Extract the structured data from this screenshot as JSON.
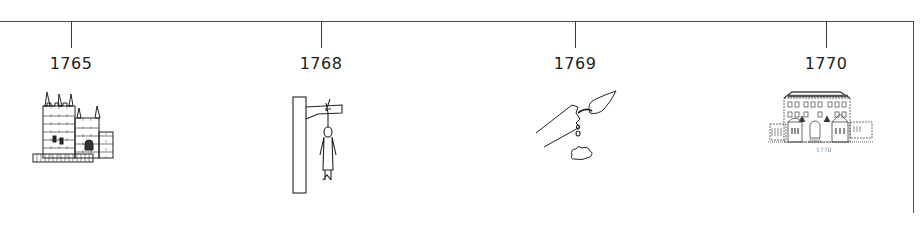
{
  "timeline": {
    "events": [
      {
        "year": "1765",
        "icon": "castle-icon",
        "x": 71
      },
      {
        "year": "1768",
        "icon": "gallows-icon",
        "x": 321
      },
      {
        "year": "1769",
        "icon": "quill-pen-icon",
        "x": 575
      },
      {
        "year": "1770",
        "icon": "mansion-icon",
        "x": 826
      }
    ],
    "mansion_caption": "1770",
    "line_color": "#4a4a4a",
    "ink_color": "#222222"
  }
}
